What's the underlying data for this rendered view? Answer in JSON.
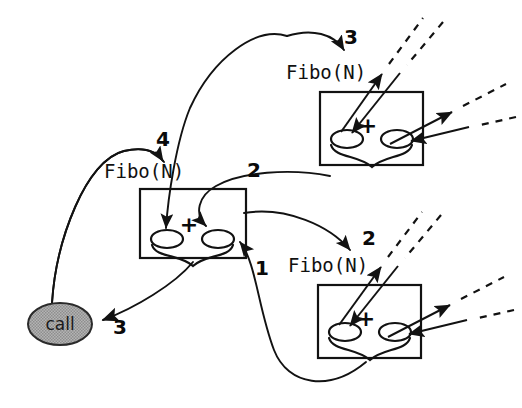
{
  "diagram": {
    "background_color": "#ffffff",
    "ink_color": "#121212",
    "call_node": {
      "label": "call",
      "fill_color": "#a9a9a9",
      "stroke_color": "#2a2a2a",
      "cx": 60,
      "cy": 324,
      "rx": 32,
      "ry": 21
    },
    "frames": [
      {
        "id": "frame-center",
        "label": "Fibo(N)",
        "label_x": 104,
        "label_y": 178,
        "x": 140,
        "y": 189,
        "width": 106,
        "height": 69,
        "operator": "+",
        "operator_x": 189,
        "operator_y": 232,
        "slots": [
          {
            "cx": 167,
            "cy": 239,
            "rx": 16,
            "ry": 9
          },
          {
            "cx": 218,
            "cy": 239,
            "rx": 16,
            "ry": 9
          }
        ]
      },
      {
        "id": "frame-top-right",
        "label": "Fibo(N)",
        "label_x": 286,
        "label_y": 79,
        "x": 320,
        "y": 92,
        "width": 103,
        "height": 73,
        "operator": "+",
        "operator_x": 368,
        "operator_y": 133,
        "slots": [
          {
            "cx": 347,
            "cy": 139,
            "rx": 16,
            "ry": 9
          },
          {
            "cx": 397,
            "cy": 139,
            "rx": 16,
            "ry": 9
          }
        ]
      },
      {
        "id": "frame-bottom-right",
        "label": "Fibo(N)",
        "label_x": 288,
        "label_y": 272,
        "x": 318,
        "y": 285,
        "width": 103,
        "height": 73,
        "operator": "+",
        "operator_x": 366,
        "operator_y": 326,
        "slots": [
          {
            "cx": 345,
            "cy": 332,
            "rx": 16,
            "ry": 9
          },
          {
            "cx": 395,
            "cy": 332,
            "rx": 16,
            "ry": 9
          }
        ]
      }
    ],
    "step_numbers": [
      {
        "id": "step-1",
        "text": "1",
        "x": 255,
        "y": 275
      },
      {
        "id": "step-2-center",
        "text": "2",
        "x": 247,
        "y": 177
      },
      {
        "id": "step-2-bottom",
        "text": "2",
        "x": 362,
        "y": 245
      },
      {
        "id": "step-3-top",
        "text": "3",
        "x": 344,
        "y": 44
      },
      {
        "id": "step-3-call",
        "text": "3",
        "x": 113,
        "y": 334
      },
      {
        "id": "step-4",
        "text": "4",
        "x": 156,
        "y": 146
      }
    ],
    "edges": [
      {
        "id": "edge-call-to-center-label",
        "from": "call",
        "to": "frame-center",
        "step": "4",
        "style": "solid-curve"
      },
      {
        "id": "edge-center-to-call",
        "from": "frame-center",
        "to": "call",
        "step": "3",
        "style": "solid-straight"
      },
      {
        "id": "edge-center-to-top-right",
        "from": "frame-center",
        "to": "frame-top-right",
        "step": "3",
        "style": "solid-curve"
      },
      {
        "id": "edge-top-right-to-center",
        "from": "frame-top-right",
        "to": "frame-center",
        "step": "2",
        "style": "solid-curve"
      },
      {
        "id": "edge-center-to-bottom-right",
        "from": "frame-center",
        "to": "frame-bottom-right",
        "step": "2",
        "style": "solid-curve"
      },
      {
        "id": "edge-bottom-right-to-center",
        "from": "frame-bottom-right",
        "to": "frame-center",
        "step": "1",
        "style": "solid-curve"
      }
    ],
    "continuation_rays": {
      "description": "arrows leaving each right-hand frame continue as dashed lines",
      "count": 4
    }
  }
}
